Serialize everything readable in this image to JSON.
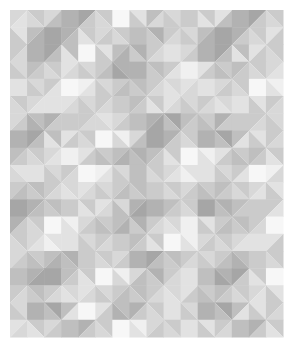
{
  "artwork": {
    "title": "Geometric Grayscale Quilt Pattern",
    "description": "Abstract tiled composition of triangles and diamonds in shades of gray on a white ground",
    "canvas": {
      "width": 293,
      "height": 347,
      "background": "#ffffff"
    },
    "pattern_area": {
      "x": 10,
      "y": 10,
      "width": 273,
      "height": 327,
      "margin": 10
    },
    "grid": {
      "cols": 16,
      "rows": 19,
      "cell_width": 17.0625,
      "cell_height": 17.2105,
      "motif_block": 34
    },
    "palette": {
      "white": "#f7f7f7",
      "near_white": "#f0f0f0",
      "light": "#e2e2e2",
      "light_mid": "#d8d8d8",
      "mid": "#cbcbcb",
      "mid_dark": "#bfbfbf",
      "dark": "#b2b2b2",
      "darkest": "#a6a6a6"
    },
    "cells": [
      [
        "tl:light_mid,br:light",
        "tl:mid,br:light_mid",
        "tl:light_mid,br:mid_dark",
        "solid:dark",
        "tl:darkest,br:mid",
        "tl:mid,br:light_mid",
        "solid:white",
        "tl:light,br:mid",
        "tl:mid_dark,br:light_mid",
        "tl:light_mid,br:mid",
        "solid:mid",
        "tl:mid,br:light",
        "tl:light,br:mid_dark",
        "solid:dark",
        "tl:darkest,br:mid",
        "tl:mid,br:light_mid"
      ],
      [
        "tl:light,br:mid",
        "tl:mid_dark,br:dark",
        "solid:darkest",
        "tl:dark,br:mid_dark",
        "tl:mid,br:light",
        "tl:light_mid,br:mid",
        "tl:mid,br:light_mid",
        "solid:mid_dark",
        "tl:dark,br:mid",
        "tl:mid,br:light_mid",
        "tl:light_mid,br:mid",
        "tl:mid_dark,br:dark",
        "solid:darkest",
        "tl:dark,br:mid",
        "tl:mid,br:light_mid",
        "tl:light,br:mid"
      ],
      [
        "tl:mid,br:light_mid",
        "solid:dark",
        "tl:darkest,br:mid_dark",
        "tl:mid_dark,br:light",
        "solid:white",
        "tl:light,br:mid",
        "tl:mid_dark,br:dark",
        "tl:dark,br:mid",
        "tl:mid,br:light_mid",
        "solid:light",
        "tl:light_mid,br:mid",
        "solid:dark",
        "tl:darkest,br:mid_dark",
        "tl:mid_dark,br:light",
        "tl:light,br:mid",
        "tl:mid,br:light_mid"
      ],
      [
        "tl:light_mid,br:mid",
        "tl:mid_dark,br:mid",
        "tl:mid,br:light_mid",
        "tl:light,br:light_mid",
        "tl:light_mid,br:mid",
        "tl:mid,br:mid_dark",
        "tl:dark,br:darkest",
        "solid:dark",
        "tl:mid_dark,br:mid",
        "tl:mid,br:light",
        "solid:near_white",
        "tl:light,br:mid",
        "tl:mid,br:mid_dark",
        "tl:mid_dark,br:mid",
        "tl:mid,br:light_mid",
        "tl:light_mid,br:light"
      ],
      [
        "solid:light",
        "tl:light_mid,br:mid",
        "tl:mid,br:light",
        "solid:white",
        "tl:near_white,br:light",
        "tl:light_mid,br:mid",
        "tl:mid,br:mid_dark",
        "tl:mid_dark,br:mid",
        "tl:mid,br:light_mid",
        "tl:light_mid,br:light",
        "tl:light,br:light_mid",
        "solid:light",
        "tl:light_mid,br:mid",
        "tl:mid,br:light_mid",
        "solid:white",
        "tl:near_white,br:light"
      ],
      [
        "tl:mid,br:light_mid",
        "tl:light_mid,br:light",
        "solid:light",
        "tl:light,br:light_mid",
        "tl:light_mid,br:mid",
        "tl:mid,br:light_mid",
        "solid:mid",
        "tl:mid_dark,br:mid",
        "tl:mid,br:light",
        "tl:light,br:light_mid",
        "tl:light_mid,br:mid",
        "tl:mid,br:light_mid",
        "tl:light_mid,br:light",
        "solid:light",
        "tl:light,br:mid",
        "tl:mid,br:light_mid"
      ],
      [
        "tl:light_mid,br:mid",
        "tl:mid_dark,br:dark",
        "tl:dark,br:mid",
        "solid:mid",
        "tl:mid,br:light_mid",
        "tl:light,br:light_mid",
        "tl:light_mid,br:mid",
        "solid:mid_dark",
        "tl:dark,br:darkest",
        "tl:darkest,br:mid_dark",
        "tl:mid_dark,br:mid",
        "tl:mid,br:mid_dark",
        "tl:dark,br:mid",
        "solid:mid",
        "tl:mid,br:light_mid",
        "tl:light_mid,br:mid"
      ],
      [
        "solid:dark",
        "tl:darkest,br:mid_dark",
        "tl:mid_dark,br:light",
        "tl:light,br:mid",
        "tl:mid,br:light_mid",
        "solid:white",
        "tl:near_white,br:light_mid",
        "tl:light_mid,br:mid_dark",
        "solid:darkest",
        "tl:dark,br:mid",
        "tl:mid,br:light_mid",
        "solid:dark",
        "tl:darkest,br:mid_dark",
        "tl:mid_dark,br:light",
        "tl:light,br:mid",
        "tl:mid,br:light_mid"
      ],
      [
        "tl:mid_dark,br:mid",
        "tl:mid,br:light_mid",
        "tl:light_mid,br:light",
        "solid:near_white",
        "tl:light,br:mid",
        "tl:mid,br:mid_dark",
        "tl:mid_dark,br:dark",
        "tl:dark,br:mid_dark",
        "tl:mid_dark,br:mid",
        "tl:mid,br:light",
        "solid:white",
        "tl:near_white,br:light",
        "tl:light,br:mid",
        "tl:mid,br:mid_dark",
        "tl:mid_dark,br:mid",
        "tl:mid,br:light"
      ],
      [
        "tl:light,br:light_mid",
        "solid:light",
        "tl:light_mid,br:mid",
        "tl:mid,br:light_mid",
        "solid:white",
        "tl:near_white,br:light",
        "tl:light_mid,br:mid",
        "solid:mid_dark",
        "tl:mid,br:light_mid",
        "tl:light_mid,br:light",
        "tl:light,br:near_white",
        "solid:light",
        "tl:light_mid,br:mid",
        "tl:mid,br:light",
        "solid:white",
        "tl:near_white,br:light_mid"
      ],
      [
        "tl:mid,br:mid_dark",
        "tl:mid_dark,br:mid",
        "tl:mid,br:light_mid",
        "tl:light_mid,br:light",
        "tl:light,br:light_mid",
        "tl:light_mid,br:mid",
        "tl:mid,br:mid_dark",
        "tl:mid_dark,br:mid",
        "solid:mid",
        "tl:mid,br:light_mid",
        "tl:light_mid,br:mid",
        "tl:mid,br:mid_dark",
        "tl:mid_dark,br:mid",
        "tl:mid,br:light_mid",
        "tl:light_mid,br:light",
        "tl:light,br:mid"
      ],
      [
        "solid:darkest",
        "tl:dark,br:mid_dark",
        "tl:mid_dark,br:mid",
        "solid:mid",
        "tl:mid,br:light",
        "tl:light,br:light_mid",
        "tl:light_mid,br:mid_dark",
        "tl:dark,br:darkest",
        "solid:dark",
        "tl:mid_dark,br:mid",
        "tl:mid,br:light_mid",
        "solid:darkest",
        "tl:dark,br:mid_dark",
        "tl:mid_dark,br:mid",
        "solid:mid",
        "tl:mid,br:light"
      ],
      [
        "tl:dark,br:mid",
        "tl:mid,br:light_mid",
        "solid:white",
        "tl:near_white,br:light",
        "tl:light_mid,br:mid",
        "tl:mid,br:mid_dark",
        "tl:mid_dark,br:dark",
        "tl:dark,br:mid",
        "tl:mid,br:light_mid",
        "tl:light_mid,br:light",
        "solid:near_white",
        "tl:light,br:mid",
        "tl:mid,br:mid_dark",
        "tl:mid_dark,br:mid",
        "tl:mid,br:light_mid",
        "solid:white"
      ],
      [
        "tl:mid,br:light_mid",
        "tl:light_mid,br:light",
        "tl:light,br:near_white",
        "solid:light",
        "tl:light_mid,br:mid",
        "tl:mid,br:light_mid",
        "solid:mid",
        "tl:mid_dark,br:mid",
        "tl:mid,br:light",
        "solid:white",
        "tl:near_white,br:light",
        "tl:light_mid,br:mid",
        "tl:mid,br:light_mid",
        "tl:light_mid,br:light",
        "solid:light",
        "tl:light,br:mid"
      ],
      [
        "tl:light_mid,br:mid",
        "tl:mid,br:mid_dark",
        "tl:mid_dark,br:dark",
        "tl:dark,br:mid_dark",
        "solid:mid",
        "tl:mid,br:light_mid",
        "tl:light_mid,br:mid",
        "solid:dark",
        "tl:darkest,br:mid_dark",
        "tl:mid_dark,br:mid",
        "tl:mid,br:light_mid",
        "tl:light_mid,br:mid",
        "tl:mid,br:mid_dark",
        "tl:mid_dark,br:dark",
        "solid:mid",
        "tl:mid,br:light_mid"
      ],
      [
        "solid:mid_dark",
        "tl:dark,br:darkest",
        "solid:darkest",
        "tl:mid_dark,br:mid",
        "tl:mid,br:light",
        "solid:white",
        "tl:near_white,br:light_mid",
        "tl:light_mid,br:mid_dark",
        "tl:dark,br:mid",
        "tl:mid,br:light_mid",
        "solid:light",
        "solid:mid_dark",
        "tl:dark,br:darkest",
        "tl:darkest,br:mid",
        "tl:mid,br:light",
        "solid:white"
      ],
      [
        "tl:mid,br:light_mid",
        "tl:mid_dark,br:mid",
        "tl:mid,br:light_mid",
        "tl:light_mid,br:light",
        "tl:light,br:light_mid",
        "tl:light_mid,br:mid",
        "tl:mid,br:mid_dark",
        "tl:mid_dark,br:mid",
        "tl:mid,br:light_mid",
        "tl:light_mid,br:light",
        "tl:light,br:mid",
        "tl:mid,br:mid_dark",
        "tl:mid_dark,br:mid",
        "tl:mid,br:light_mid",
        "tl:light_mid,br:light",
        "tl:light,br:mid"
      ],
      [
        "tl:light_mid,br:mid",
        "solid:dark",
        "tl:darkest,br:mid_dark",
        "tl:mid_dark,br:light",
        "solid:white",
        "tl:light,br:mid",
        "tl:mid_dark,br:dark",
        "tl:dark,br:mid",
        "tl:mid,br:light_mid",
        "solid:light",
        "tl:light_mid,br:mid",
        "solid:dark",
        "tl:darkest,br:mid_dark",
        "tl:mid_dark,br:light",
        "tl:light,br:mid",
        "tl:mid,br:light_mid"
      ],
      [
        "tl:light,br:light_mid",
        "tl:mid,br:light",
        "tl:light_mid,br:mid",
        "solid:mid_dark",
        "tl:dark,br:mid",
        "tl:mid,br:light_mid",
        "solid:white",
        "tl:near_white,br:light",
        "tl:light_mid,br:mid",
        "tl:mid,br:light_mid",
        "solid:light",
        "tl:light,br:mid",
        "tl:mid,br:light_mid",
        "solid:mid_dark",
        "tl:dark,br:mid",
        "tl:mid,br:light"
      ]
    ]
  }
}
